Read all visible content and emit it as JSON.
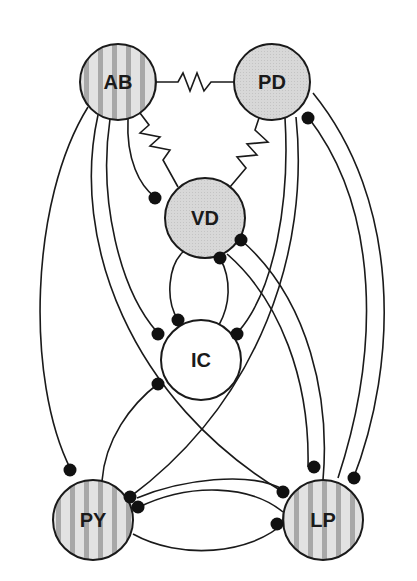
{
  "diagram": {
    "title": "",
    "colors": {
      "solid_fill": "#d6d6d6",
      "striped_base": "#e2e2e2",
      "stripe": "#a8a8a8",
      "white_fill": "#ffffff",
      "stroke": "#1a1a1a",
      "synapse": "#111111"
    },
    "nodes": [
      {
        "id": "AB",
        "label": "AB",
        "fill": "striped",
        "cx": 118,
        "cy": 82,
        "r": 38
      },
      {
        "id": "PD",
        "label": "PD",
        "fill": "solid",
        "cx": 272,
        "cy": 82,
        "r": 38
      },
      {
        "id": "VD",
        "label": "VD",
        "fill": "solid",
        "cx": 205,
        "cy": 218,
        "r": 40
      },
      {
        "id": "IC",
        "label": "IC",
        "fill": "white",
        "cx": 201,
        "cy": 360,
        "r": 40
      },
      {
        "id": "PY",
        "label": "PY",
        "fill": "striped",
        "cx": 93,
        "cy": 520,
        "r": 40
      },
      {
        "id": "LP",
        "label": "LP",
        "fill": "striped",
        "cx": 323,
        "cy": 520,
        "r": 40
      }
    ],
    "electrical_couplings": [
      {
        "from": "AB",
        "to": "PD"
      },
      {
        "from": "AB",
        "to": "VD"
      },
      {
        "from": "PD",
        "to": "VD"
      }
    ],
    "inhibitory_synapses": [
      {
        "from": "AB",
        "to": "VD"
      },
      {
        "from": "AB",
        "to": "IC"
      },
      {
        "from": "AB",
        "to": "PY"
      },
      {
        "from": "AB",
        "to": "LP"
      },
      {
        "from": "PD",
        "to": "IC"
      },
      {
        "from": "PD",
        "to": "PY"
      },
      {
        "from": "PD",
        "to": "LP"
      },
      {
        "from": "LP",
        "to": "PD"
      },
      {
        "from": "VD",
        "to": "IC"
      },
      {
        "from": "IC",
        "to": "VD"
      },
      {
        "from": "VD",
        "to": "LP"
      },
      {
        "from": "LP",
        "to": "VD"
      },
      {
        "from": "IC",
        "to": "PY"
      },
      {
        "from": "PY",
        "to": "IC"
      },
      {
        "from": "PY",
        "to": "LP"
      },
      {
        "from": "LP",
        "to": "PY"
      }
    ]
  }
}
